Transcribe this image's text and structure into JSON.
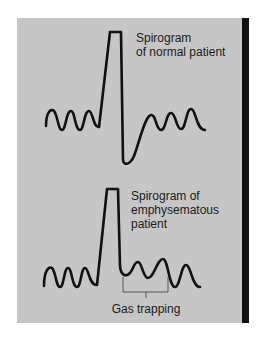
{
  "figure": {
    "background_color": "#c6c6c6",
    "line_color": "#111111",
    "side_bar_color": "#111111"
  },
  "normal": {
    "label_lines": [
      "Spirogram",
      "of normal patient"
    ]
  },
  "emphysema": {
    "label_lines": [
      "Spirogram of",
      "emphysematous",
      "patient"
    ],
    "annotation": "Gas trapping"
  }
}
